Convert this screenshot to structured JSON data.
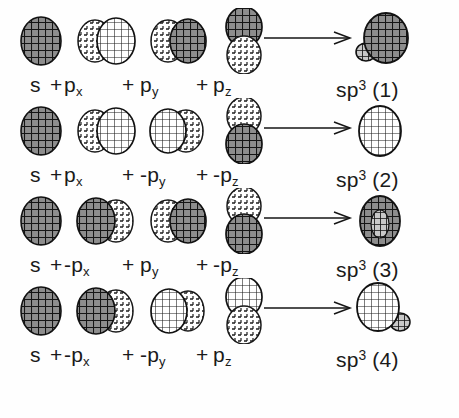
{
  "figure": {
    "background_color": "#fefefe",
    "ink_color": "#1a1a1a",
    "plus_sign": "+",
    "arrow": "→",
    "rows": [
      {
        "index": 1,
        "terms": [
          {
            "sign": "",
            "base": "s",
            "sub": ""
          },
          {
            "sign": "",
            "base": "p",
            "sub": "x"
          },
          {
            "sign": "",
            "base": "p",
            "sub": "y"
          },
          {
            "sign": "",
            "base": "p",
            "sub": "z"
          }
        ],
        "result": {
          "base": "sp",
          "exp": "3",
          "number": "(1)"
        },
        "orbitals": {
          "s": {
            "type": "sphere",
            "shade": "dark"
          },
          "px": {
            "type": "p-horizontal",
            "left_lobe": "light",
            "right_lobe": "dark"
          },
          "py": {
            "type": "p-horizontal",
            "left_lobe": "light",
            "right_lobe": "dark"
          },
          "pz": {
            "type": "p-vertical",
            "top_lobe": "dark",
            "bottom_lobe": "light"
          },
          "hybrid": {
            "type": "hybrid",
            "big_lobe": "dark",
            "small_lobe_position": "lower-left"
          }
        }
      },
      {
        "index": 2,
        "terms": [
          {
            "sign": "",
            "base": "s",
            "sub": ""
          },
          {
            "sign": "",
            "base": "p",
            "sub": "x"
          },
          {
            "sign": "-",
            "base": "p",
            "sub": "y"
          },
          {
            "sign": "-",
            "base": "p",
            "sub": "z"
          }
        ],
        "result": {
          "base": "sp",
          "exp": "3",
          "number": "(2)"
        },
        "orbitals": {
          "s": {
            "type": "sphere",
            "shade": "dark"
          },
          "px": {
            "type": "p-horizontal",
            "left_lobe": "light",
            "right_lobe": "dark"
          },
          "py": {
            "type": "p-horizontal",
            "left_lobe": "dark",
            "right_lobe": "light"
          },
          "pz": {
            "type": "p-vertical",
            "top_lobe": "light",
            "bottom_lobe": "dark"
          },
          "hybrid": {
            "type": "hybrid",
            "big_lobe": "light",
            "small_lobe_position": "none"
          }
        }
      },
      {
        "index": 3,
        "terms": [
          {
            "sign": "",
            "base": "s",
            "sub": ""
          },
          {
            "sign": "-",
            "base": "p",
            "sub": "x"
          },
          {
            "sign": "",
            "base": "p",
            "sub": "y"
          },
          {
            "sign": "-",
            "base": "p",
            "sub": "z"
          }
        ],
        "result": {
          "base": "sp",
          "exp": "3",
          "number": "(3)"
        },
        "orbitals": {
          "s": {
            "type": "sphere",
            "shade": "dark"
          },
          "px": {
            "type": "p-horizontal",
            "left_lobe": "dark",
            "right_lobe": "light"
          },
          "py": {
            "type": "p-horizontal",
            "left_lobe": "light",
            "right_lobe": "dark"
          },
          "pz": {
            "type": "p-vertical",
            "top_lobe": "light",
            "bottom_lobe": "dark"
          },
          "hybrid": {
            "type": "hybrid",
            "big_lobe": "dark",
            "small_lobe_position": "center"
          }
        }
      },
      {
        "index": 4,
        "terms": [
          {
            "sign": "",
            "base": "s",
            "sub": ""
          },
          {
            "sign": "-",
            "base": "p",
            "sub": "x"
          },
          {
            "sign": "-",
            "base": "p",
            "sub": "y"
          },
          {
            "sign": "",
            "base": "p",
            "sub": "z"
          }
        ],
        "result": {
          "base": "sp",
          "exp": "3",
          "number": "(4)"
        },
        "orbitals": {
          "s": {
            "type": "sphere",
            "shade": "dark"
          },
          "px": {
            "type": "p-horizontal",
            "left_lobe": "dark",
            "right_lobe": "light"
          },
          "py": {
            "type": "p-horizontal",
            "left_lobe": "dark",
            "right_lobe": "light"
          },
          "pz": {
            "type": "p-vertical",
            "top_lobe": "dark",
            "bottom_lobe": "light"
          },
          "hybrid": {
            "type": "hybrid",
            "big_lobe": "light",
            "small_lobe_position": "lower-right"
          }
        }
      }
    ]
  }
}
